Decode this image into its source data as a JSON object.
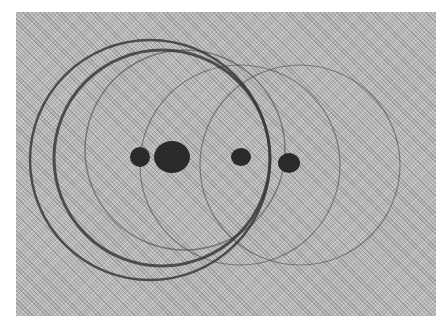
{
  "image": {
    "description": "Halftone photograph of overlapping circular rings with four dark dots along a horizontal line",
    "colors": {
      "background": "#ffffff",
      "frame": "#b9b9b9",
      "ring": "#3a3a3a",
      "dot": "#2a2a2a"
    },
    "rings": [
      {
        "cx": 150,
        "cy": 160,
        "r": 120,
        "stroke": 2.5
      },
      {
        "cx": 162,
        "cy": 158,
        "r": 108,
        "stroke": 3
      },
      {
        "cx": 185,
        "cy": 150,
        "r": 100,
        "stroke": 1.5
      },
      {
        "cx": 240,
        "cy": 165,
        "r": 100,
        "stroke": 1.2
      },
      {
        "cx": 300,
        "cy": 165,
        "r": 100,
        "stroke": 1.2
      }
    ],
    "dots": [
      {
        "cx": 140,
        "cy": 157,
        "rx": 10,
        "ry": 10
      },
      {
        "cx": 172,
        "cy": 157,
        "rx": 18,
        "ry": 16
      },
      {
        "cx": 241,
        "cy": 157,
        "rx": 10,
        "ry": 9
      },
      {
        "cx": 289,
        "cy": 163,
        "rx": 11,
        "ry": 10
      }
    ]
  }
}
